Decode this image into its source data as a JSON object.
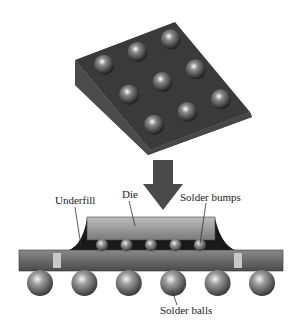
{
  "figure": {
    "top_image": "BGA chip package with 3x3 solder ball array (photo)",
    "arrow": "down-arrow",
    "labels": {
      "die": "Die",
      "underfill": "Underfill",
      "solder_bumps": "Solder bumps",
      "solder_balls": "Solder balls"
    },
    "bump_count": 5,
    "ball_count": 6,
    "chip_ball_grid": "3x3"
  }
}
